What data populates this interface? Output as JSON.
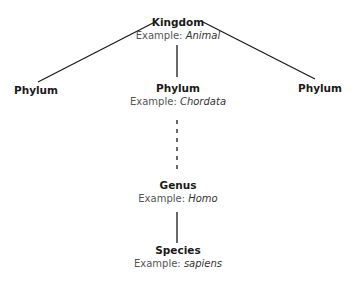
{
  "diagram": {
    "type": "taxonomy-hierarchy",
    "nodes": {
      "kingdom": {
        "title": "Kingdom",
        "example_prefix": "Example: ",
        "example_value": "Animal"
      },
      "phylum_left": {
        "title": "Phylum"
      },
      "phylum_center": {
        "title": "Phylum",
        "example_prefix": "Example: ",
        "example_value": "Chordata"
      },
      "phylum_right": {
        "title": "Phylum"
      },
      "genus": {
        "title": "Genus",
        "example_prefix": "Example: ",
        "example_value": "Homo"
      },
      "species": {
        "title": "Species",
        "example_prefix": "Example: ",
        "example_value": "sapiens"
      }
    },
    "edges": [
      {
        "from": "kingdom",
        "to": "phylum_left",
        "style": "solid"
      },
      {
        "from": "kingdom",
        "to": "phylum_center",
        "style": "solid"
      },
      {
        "from": "kingdom",
        "to": "phylum_right",
        "style": "solid"
      },
      {
        "from": "phylum_center",
        "to": "genus",
        "style": "dashed"
      },
      {
        "from": "genus",
        "to": "species",
        "style": "solid"
      }
    ],
    "colors": {
      "line": "#1a1a1a",
      "title": "#1a1a1a",
      "example": "#555555"
    }
  }
}
